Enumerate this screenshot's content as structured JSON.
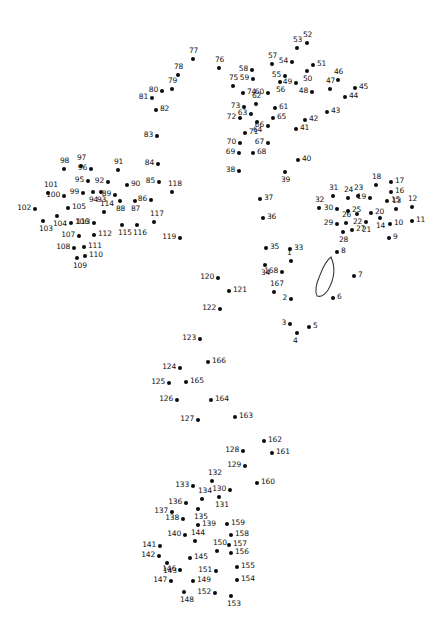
{
  "canvas": {
    "width": 442,
    "height": 618,
    "background": "#ffffff",
    "dot_color": "#0b0b0b",
    "label_color": "#111111"
  },
  "artwork": {
    "type": "connect-the-dots-puzzle",
    "total_dots": 168,
    "shapes": [
      {
        "name": "leaf-eye-outline",
        "description": "narrow pointed petal/leaf outline drawn in the center-right",
        "stroke": "#3a3a3a",
        "x": 311,
        "y": 256,
        "width": 26,
        "height": 42
      }
    ]
  },
  "dots": [
    {
      "n": "1",
      "x": 291,
      "y": 261,
      "lab": "lab-t"
    },
    {
      "n": "2",
      "x": 291,
      "y": 299,
      "lab": "lab-l"
    },
    {
      "n": "3",
      "x": 290,
      "y": 324,
      "lab": "lab-l"
    },
    {
      "n": "4",
      "x": 297,
      "y": 333,
      "lab": "lab-b"
    },
    {
      "n": "5",
      "x": 309,
      "y": 327,
      "lab": "lab-r"
    },
    {
      "n": "6",
      "x": 333,
      "y": 298,
      "lab": "lab-r"
    },
    {
      "n": "7",
      "x": 354,
      "y": 276,
      "lab": "lab-r"
    },
    {
      "n": "8",
      "x": 337,
      "y": 252,
      "lab": "lab-r"
    },
    {
      "n": "9",
      "x": 389,
      "y": 238,
      "lab": "lab-r"
    },
    {
      "n": "10",
      "x": 390,
      "y": 224,
      "lab": "lab-r"
    },
    {
      "n": "11",
      "x": 412,
      "y": 221,
      "lab": "lab-r"
    },
    {
      "n": "12",
      "x": 412,
      "y": 207,
      "lab": "lab-t"
    },
    {
      "n": "13",
      "x": 396,
      "y": 209,
      "lab": "lab-t"
    },
    {
      "n": "14",
      "x": 380,
      "y": 218,
      "lab": "lab-b"
    },
    {
      "n": "15",
      "x": 387,
      "y": 201,
      "lab": "lab-r"
    },
    {
      "n": "16",
      "x": 391,
      "y": 192,
      "lab": "lab-r"
    },
    {
      "n": "17",
      "x": 391,
      "y": 182,
      "lab": "lab-r"
    },
    {
      "n": "18",
      "x": 376,
      "y": 185,
      "lab": "lab-t"
    },
    {
      "n": "19",
      "x": 370,
      "y": 198,
      "lab": "lab-l"
    },
    {
      "n": "20",
      "x": 371,
      "y": 213,
      "lab": "lab-r"
    },
    {
      "n": "21",
      "x": 366,
      "y": 222,
      "lab": "lab-b"
    },
    {
      "n": "22",
      "x": 357,
      "y": 214,
      "lab": "lab-b"
    },
    {
      "n": "23",
      "x": 358,
      "y": 196,
      "lab": "lab-t"
    },
    {
      "n": "24",
      "x": 348,
      "y": 198,
      "lab": "lab-t"
    },
    {
      "n": "25",
      "x": 348,
      "y": 211,
      "lab": "lab-r"
    },
    {
      "n": "26",
      "x": 346,
      "y": 223,
      "lab": "lab-t"
    },
    {
      "n": "27",
      "x": 352,
      "y": 230,
      "lab": "lab-r"
    },
    {
      "n": "28",
      "x": 343,
      "y": 232,
      "lab": "lab-b"
    },
    {
      "n": "29",
      "x": 337,
      "y": 224,
      "lab": "lab-l"
    },
    {
      "n": "30",
      "x": 337,
      "y": 209,
      "lab": "lab-l"
    },
    {
      "n": "31",
      "x": 333,
      "y": 196,
      "lab": "lab-t"
    },
    {
      "n": "32",
      "x": 319,
      "y": 208,
      "lab": "lab-t"
    },
    {
      "n": "33",
      "x": 290,
      "y": 249,
      "lab": "lab-r"
    },
    {
      "n": "34",
      "x": 265,
      "y": 265,
      "lab": "lab-b"
    },
    {
      "n": "35",
      "x": 266,
      "y": 248,
      "lab": "lab-r"
    },
    {
      "n": "36",
      "x": 263,
      "y": 218,
      "lab": "lab-r"
    },
    {
      "n": "37",
      "x": 260,
      "y": 199,
      "lab": "lab-r"
    },
    {
      "n": "38",
      "x": 239,
      "y": 171,
      "lab": "lab-l"
    },
    {
      "n": "39",
      "x": 285,
      "y": 172,
      "lab": "lab-b"
    },
    {
      "n": "40",
      "x": 298,
      "y": 160,
      "lab": "lab-r"
    },
    {
      "n": "41",
      "x": 296,
      "y": 129,
      "lab": "lab-r"
    },
    {
      "n": "42",
      "x": 305,
      "y": 120,
      "lab": "lab-r"
    },
    {
      "n": "43",
      "x": 327,
      "y": 112,
      "lab": "lab-r"
    },
    {
      "n": "44",
      "x": 345,
      "y": 97,
      "lab": "lab-r"
    },
    {
      "n": "45",
      "x": 355,
      "y": 88,
      "lab": "lab-r"
    },
    {
      "n": "46",
      "x": 338,
      "y": 80,
      "lab": "lab-t"
    },
    {
      "n": "47",
      "x": 330,
      "y": 89,
      "lab": "lab-t"
    },
    {
      "n": "48",
      "x": 312,
      "y": 92,
      "lab": "lab-l"
    },
    {
      "n": "49",
      "x": 296,
      "y": 83,
      "lab": "lab-l"
    },
    {
      "n": "50",
      "x": 307,
      "y": 71,
      "lab": "lab-b"
    },
    {
      "n": "51",
      "x": 313,
      "y": 65,
      "lab": "lab-r"
    },
    {
      "n": "52",
      "x": 307,
      "y": 43,
      "lab": "lab-t"
    },
    {
      "n": "53",
      "x": 297,
      "y": 48,
      "lab": "lab-t"
    },
    {
      "n": "54",
      "x": 292,
      "y": 62,
      "lab": "lab-l"
    },
    {
      "n": "55",
      "x": 285,
      "y": 76,
      "lab": "lab-l"
    },
    {
      "n": "56",
      "x": 280,
      "y": 82,
      "lab": "lab-b"
    },
    {
      "n": "57",
      "x": 272,
      "y": 64,
      "lab": "lab-t"
    },
    {
      "n": "58",
      "x": 252,
      "y": 70,
      "lab": "lab-l"
    },
    {
      "n": "59",
      "x": 253,
      "y": 79,
      "lab": "lab-l"
    },
    {
      "n": "60",
      "x": 268,
      "y": 93,
      "lab": "lab-l"
    },
    {
      "n": "61",
      "x": 275,
      "y": 108,
      "lab": "lab-r"
    },
    {
      "n": "62",
      "x": 256,
      "y": 104,
      "lab": "lab-t"
    },
    {
      "n": "63",
      "x": 251,
      "y": 114,
      "lab": "lab-l"
    },
    {
      "n": "64",
      "x": 257,
      "y": 122,
      "lab": "lab-b"
    },
    {
      "n": "65",
      "x": 273,
      "y": 118,
      "lab": "lab-r"
    },
    {
      "n": "66",
      "x": 268,
      "y": 126,
      "lab": "lab-l"
    },
    {
      "n": "67",
      "x": 268,
      "y": 143,
      "lab": "lab-l"
    },
    {
      "n": "68",
      "x": 253,
      "y": 153,
      "lab": "lab-r"
    },
    {
      "n": "69",
      "x": 239,
      "y": 153,
      "lab": "lab-l"
    },
    {
      "n": "70",
      "x": 240,
      "y": 143,
      "lab": "lab-l"
    },
    {
      "n": "71",
      "x": 245,
      "y": 133,
      "lab": "lab-r"
    },
    {
      "n": "72",
      "x": 240,
      "y": 118,
      "lab": "lab-l"
    },
    {
      "n": "73",
      "x": 244,
      "y": 107,
      "lab": "lab-l"
    },
    {
      "n": "74",
      "x": 243,
      "y": 93,
      "lab": "lab-r"
    },
    {
      "n": "75",
      "x": 233,
      "y": 86,
      "lab": "lab-t"
    },
    {
      "n": "76",
      "x": 219,
      "y": 68,
      "lab": "lab-t"
    },
    {
      "n": "77",
      "x": 193,
      "y": 59,
      "lab": "lab-t"
    },
    {
      "n": "78",
      "x": 178,
      "y": 75,
      "lab": "lab-t"
    },
    {
      "n": "79",
      "x": 172,
      "y": 89,
      "lab": "lab-t"
    },
    {
      "n": "80",
      "x": 162,
      "y": 91,
      "lab": "lab-l"
    },
    {
      "n": "81",
      "x": 152,
      "y": 98,
      "lab": "lab-l"
    },
    {
      "n": "82",
      "x": 156,
      "y": 110,
      "lab": "lab-r"
    },
    {
      "n": "83",
      "x": 157,
      "y": 136,
      "lab": "lab-l"
    },
    {
      "n": "84",
      "x": 158,
      "y": 164,
      "lab": "lab-l"
    },
    {
      "n": "85",
      "x": 159,
      "y": 182,
      "lab": "lab-l"
    },
    {
      "n": "86",
      "x": 151,
      "y": 200,
      "lab": "lab-l"
    },
    {
      "n": "87",
      "x": 135,
      "y": 201,
      "lab": "lab-b"
    },
    {
      "n": "88",
      "x": 120,
      "y": 201,
      "lab": "lab-b"
    },
    {
      "n": "89",
      "x": 115,
      "y": 195,
      "lab": "lab-l"
    },
    {
      "n": "90",
      "x": 127,
      "y": 185,
      "lab": "lab-r"
    },
    {
      "n": "91",
      "x": 118,
      "y": 170,
      "lab": "lab-t"
    },
    {
      "n": "92",
      "x": 108,
      "y": 182,
      "lab": "lab-l"
    },
    {
      "n": "93",
      "x": 101,
      "y": 192,
      "lab": "lab-b"
    },
    {
      "n": "94",
      "x": 93,
      "y": 192,
      "lab": "lab-b"
    },
    {
      "n": "95",
      "x": 88,
      "y": 181,
      "lab": "lab-l"
    },
    {
      "n": "96",
      "x": 91,
      "y": 169,
      "lab": "lab-l"
    },
    {
      "n": "97",
      "x": 81,
      "y": 166,
      "lab": "lab-t"
    },
    {
      "n": "98",
      "x": 64,
      "y": 169,
      "lab": "lab-t"
    },
    {
      "n": "99",
      "x": 83,
      "y": 193,
      "lab": "lab-l"
    },
    {
      "n": "100",
      "x": 64,
      "y": 196,
      "lab": "lab-l"
    },
    {
      "n": "101",
      "x": 48,
      "y": 193,
      "lab": "lab-t"
    },
    {
      "n": "102",
      "x": 35,
      "y": 209,
      "lab": "lab-l"
    },
    {
      "n": "103",
      "x": 43,
      "y": 221,
      "lab": "lab-b"
    },
    {
      "n": "104",
      "x": 57,
      "y": 216,
      "lab": "lab-b"
    },
    {
      "n": "105",
      "x": 68,
      "y": 208,
      "lab": "lab-r"
    },
    {
      "n": "106",
      "x": 71,
      "y": 223,
      "lab": "lab-r"
    },
    {
      "n": "107",
      "x": 79,
      "y": 236,
      "lab": "lab-l"
    },
    {
      "n": "108",
      "x": 74,
      "y": 248,
      "lab": "lab-l"
    },
    {
      "n": "109",
      "x": 77,
      "y": 258,
      "lab": "lab-b"
    },
    {
      "n": "110",
      "x": 85,
      "y": 256,
      "lab": "lab-r"
    },
    {
      "n": "111",
      "x": 84,
      "y": 247,
      "lab": "lab-r"
    },
    {
      "n": "112",
      "x": 94,
      "y": 235,
      "lab": "lab-r"
    },
    {
      "n": "113",
      "x": 94,
      "y": 223,
      "lab": "lab-l"
    },
    {
      "n": "114",
      "x": 104,
      "y": 212,
      "lab": "lab-t"
    },
    {
      "n": "115",
      "x": 122,
      "y": 225,
      "lab": "lab-b"
    },
    {
      "n": "116",
      "x": 137,
      "y": 225,
      "lab": "lab-b"
    },
    {
      "n": "117",
      "x": 154,
      "y": 222,
      "lab": "lab-t"
    },
    {
      "n": "118",
      "x": 172,
      "y": 192,
      "lab": "lab-t"
    },
    {
      "n": "119",
      "x": 180,
      "y": 238,
      "lab": "lab-l"
    },
    {
      "n": "120",
      "x": 218,
      "y": 278,
      "lab": "lab-l"
    },
    {
      "n": "121",
      "x": 229,
      "y": 291,
      "lab": "lab-r"
    },
    {
      "n": "122",
      "x": 220,
      "y": 309,
      "lab": "lab-l"
    },
    {
      "n": "123",
      "x": 200,
      "y": 339,
      "lab": "lab-l"
    },
    {
      "n": "124",
      "x": 180,
      "y": 368,
      "lab": "lab-l"
    },
    {
      "n": "125",
      "x": 169,
      "y": 383,
      "lab": "lab-l"
    },
    {
      "n": "126",
      "x": 177,
      "y": 400,
      "lab": "lab-l"
    },
    {
      "n": "127",
      "x": 198,
      "y": 420,
      "lab": "lab-l"
    },
    {
      "n": "128",
      "x": 243,
      "y": 451,
      "lab": "lab-l"
    },
    {
      "n": "129",
      "x": 245,
      "y": 466,
      "lab": "lab-l"
    },
    {
      "n": "130",
      "x": 230,
      "y": 490,
      "lab": "lab-l"
    },
    {
      "n": "131",
      "x": 219,
      "y": 497,
      "lab": "lab-b"
    },
    {
      "n": "132",
      "x": 212,
      "y": 481,
      "lab": "lab-t"
    },
    {
      "n": "133",
      "x": 193,
      "y": 486,
      "lab": "lab-l"
    },
    {
      "n": "134",
      "x": 202,
      "y": 499,
      "lab": "lab-t"
    },
    {
      "n": "135",
      "x": 198,
      "y": 509,
      "lab": "lab-b"
    },
    {
      "n": "136",
      "x": 186,
      "y": 503,
      "lab": "lab-l"
    },
    {
      "n": "137",
      "x": 172,
      "y": 512,
      "lab": "lab-l"
    },
    {
      "n": "138",
      "x": 183,
      "y": 519,
      "lab": "lab-l"
    },
    {
      "n": "139",
      "x": 198,
      "y": 525,
      "lab": "lab-r"
    },
    {
      "n": "140",
      "x": 185,
      "y": 535,
      "lab": "lab-l"
    },
    {
      "n": "141",
      "x": 160,
      "y": 546,
      "lab": "lab-l"
    },
    {
      "n": "142",
      "x": 159,
      "y": 556,
      "lab": "lab-l"
    },
    {
      "n": "143",
      "x": 167,
      "y": 563,
      "lab": "lab-b"
    },
    {
      "n": "144",
      "x": 195,
      "y": 541,
      "lab": "lab-t"
    },
    {
      "n": "145",
      "x": 190,
      "y": 558,
      "lab": "lab-r"
    },
    {
      "n": "146",
      "x": 180,
      "y": 570,
      "lab": "lab-l"
    },
    {
      "n": "147",
      "x": 171,
      "y": 581,
      "lab": "lab-l"
    },
    {
      "n": "148",
      "x": 184,
      "y": 592,
      "lab": "lab-b"
    },
    {
      "n": "149",
      "x": 193,
      "y": 581,
      "lab": "lab-r"
    },
    {
      "n": "150",
      "x": 217,
      "y": 551,
      "lab": "lab-t"
    },
    {
      "n": "151",
      "x": 216,
      "y": 571,
      "lab": "lab-l"
    },
    {
      "n": "152",
      "x": 215,
      "y": 593,
      "lab": "lab-l"
    },
    {
      "n": "153",
      "x": 231,
      "y": 596,
      "lab": "lab-b"
    },
    {
      "n": "154",
      "x": 237,
      "y": 580,
      "lab": "lab-r"
    },
    {
      "n": "155",
      "x": 237,
      "y": 567,
      "lab": "lab-r"
    },
    {
      "n": "156",
      "x": 231,
      "y": 553,
      "lab": "lab-r"
    },
    {
      "n": "157",
      "x": 229,
      "y": 545,
      "lab": "lab-r"
    },
    {
      "n": "158",
      "x": 231,
      "y": 535,
      "lab": "lab-r"
    },
    {
      "n": "159",
      "x": 227,
      "y": 524,
      "lab": "lab-r"
    },
    {
      "n": "160",
      "x": 257,
      "y": 483,
      "lab": "lab-r"
    },
    {
      "n": "161",
      "x": 272,
      "y": 453,
      "lab": "lab-r"
    },
    {
      "n": "162",
      "x": 264,
      "y": 441,
      "lab": "lab-r"
    },
    {
      "n": "163",
      "x": 235,
      "y": 417,
      "lab": "lab-r"
    },
    {
      "n": "164",
      "x": 211,
      "y": 400,
      "lab": "lab-r"
    },
    {
      "n": "165",
      "x": 186,
      "y": 382,
      "lab": "lab-r"
    },
    {
      "n": "166",
      "x": 208,
      "y": 362,
      "lab": "lab-r"
    },
    {
      "n": "167",
      "x": 274,
      "y": 292,
      "lab": "lab-t"
    },
    {
      "n": "168",
      "x": 282,
      "y": 272,
      "lab": "lab-l"
    }
  ]
}
